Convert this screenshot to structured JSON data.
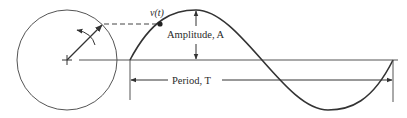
{
  "diagram": {
    "labels": {
      "signal": "v(t)",
      "amplitude": "Amplitude, A",
      "period": "Period, T"
    },
    "colors": {
      "stroke": "#333333",
      "background": "#ffffff"
    },
    "elements": {
      "circle": {
        "cx": 67,
        "cy": 60,
        "r": 50
      },
      "waveform": {
        "type": "sine",
        "start_x": 130,
        "end_x": 393,
        "baseline_y": 60,
        "amplitude_px": 50
      }
    }
  }
}
